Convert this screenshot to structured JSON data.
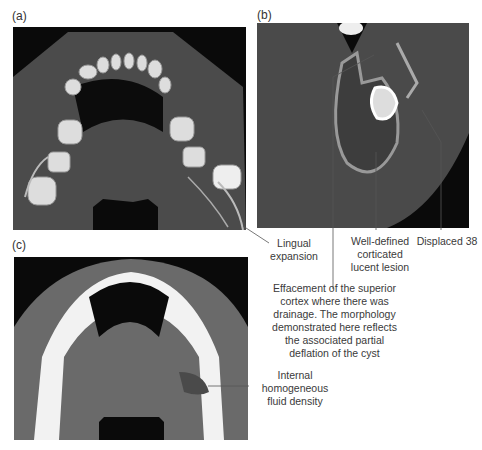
{
  "figure": {
    "panels": [
      {
        "label": "(a)",
        "description": "Axial CT, bone window, mandible with teeth"
      },
      {
        "label": "(b)",
        "description": "CT section showing lesion with displaced tooth"
      },
      {
        "label": "(c)",
        "description": "Axial CT, soft tissue window"
      }
    ],
    "annotations": {
      "lingual_expansion": "Lingual\nexpansion",
      "well_defined": "Well-defined\ncorticated\nlucent lesion",
      "displaced": "Displaced 38",
      "effacement": "Effacement of the superior\ncortex where there was\ndrainage. The morphology\ndemonstrated here reflects\nthe associated partial\ndeflation of the cyst",
      "internal": "Internal\nhomogeneous\nfluid density"
    },
    "colors": {
      "background": "#ffffff",
      "image_black": "#0a0a0a",
      "soft_tissue": "#4a4a4a",
      "bone": "#e8e8e8",
      "leader": "#555555"
    }
  }
}
